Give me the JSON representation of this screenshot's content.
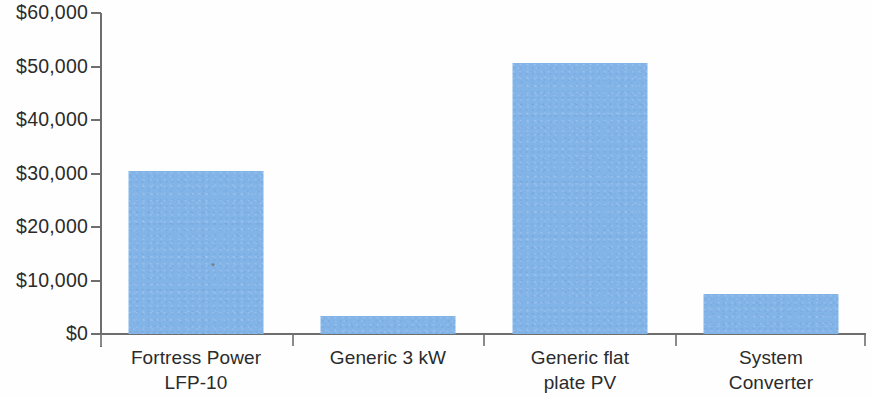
{
  "chart_data": {
    "type": "bar",
    "title": "",
    "subtitle": "",
    "xlabel": "",
    "ylabel": "",
    "categories": [
      "Fortress Power LFP-10",
      "Generic 3 kW",
      "Generic flat plate PV",
      "System Converter"
    ],
    "category_lines": [
      [
        "Fortress Power",
        "LFP-10"
      ],
      [
        "Generic 3 kW"
      ],
      [
        "Generic flat",
        "plate PV"
      ],
      [
        "System",
        "Converter"
      ]
    ],
    "values": [
      30400,
      3400,
      50600,
      7400
    ],
    "ylim": [
      0,
      60000
    ],
    "ytick_values": [
      0,
      10000,
      20000,
      30000,
      40000,
      50000,
      60000
    ],
    "ytick_labels": [
      "$0",
      "$10,000",
      "$20,000",
      "$30,000",
      "$40,000",
      "$50,000",
      "$60,000"
    ],
    "grid": false,
    "legend": "none",
    "bar_color": "#83b4e8",
    "axis_color": "#6e6e6e",
    "text_color": "#2b2b2b",
    "background_color": "#ffffff"
  },
  "axis": {
    "y_labels": [
      {
        "text": "$60,000",
        "value": 60000
      },
      {
        "text": "$50,000",
        "value": 50000
      },
      {
        "text": "$40,000",
        "value": 40000
      },
      {
        "text": "$30,000",
        "value": 30000
      },
      {
        "text": "$20,000",
        "value": 20000
      },
      {
        "text": "$10,000",
        "value": 10000
      },
      {
        "text": "$0",
        "value": 0
      }
    ]
  }
}
